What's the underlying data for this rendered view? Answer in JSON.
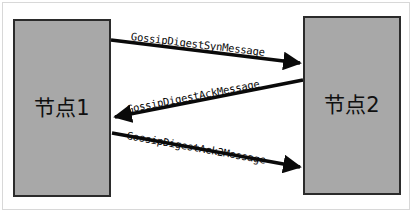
{
  "diagram": {
    "type": "sequence-diagram",
    "background_color": "#ffffff",
    "node_fill_color": "#a8a8a8",
    "node_border_color": "#2b2b2b",
    "arrow_color": "#0a0a0a",
    "nodes": [
      {
        "id": "node-left",
        "label": "节点1"
      },
      {
        "id": "node-right",
        "label": "节点2"
      }
    ],
    "messages": [
      {
        "label": "GossipDigestSynMessage",
        "from": "节点1",
        "to": "节点2",
        "direction": "left-to-right"
      },
      {
        "label": "GossipDigestAckMessage",
        "from": "节点2",
        "to": "节点1",
        "direction": "right-to-left"
      },
      {
        "label": "GossipDigestAck2Message",
        "from": "节点1",
        "to": "节点2",
        "direction": "left-to-right"
      }
    ]
  }
}
